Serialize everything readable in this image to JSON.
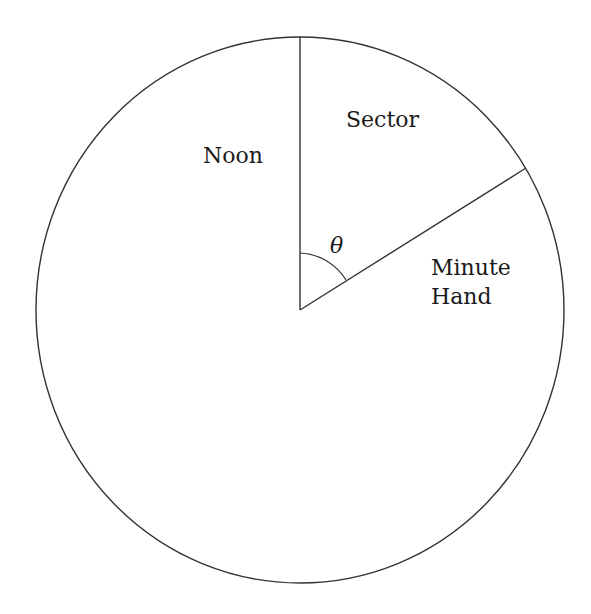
{
  "diagram": {
    "type": "clock-sector",
    "labels": {
      "noon": "Noon",
      "sector": "Sector",
      "angle": "θ",
      "minute_hand_line1": "Minute",
      "minute_hand_line2": "Hand"
    },
    "colors": {
      "stroke": "#333333",
      "text": "#1a1a1a",
      "background": "#ffffff"
    }
  }
}
